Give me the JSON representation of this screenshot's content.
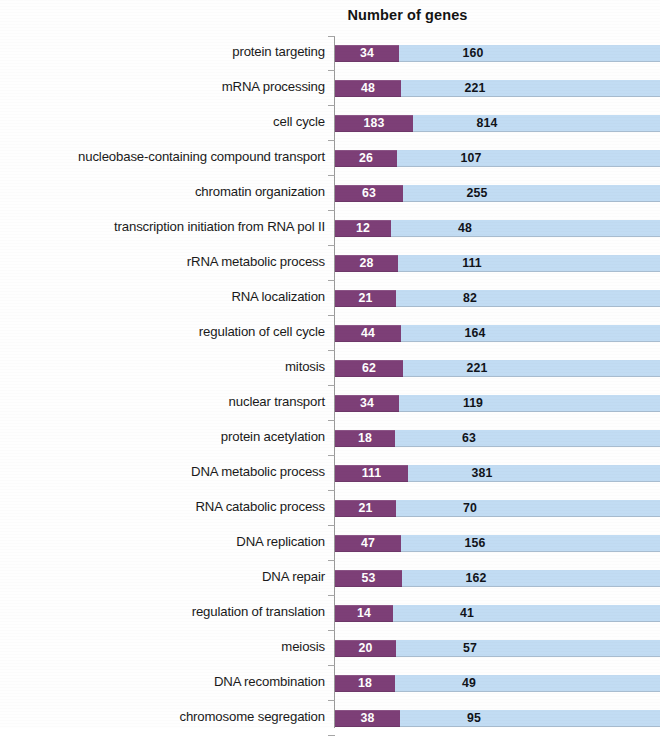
{
  "chart_data": {
    "type": "bar",
    "title": "Number of genes",
    "xlabel": "",
    "ylabel": "",
    "orientation": "horizontal",
    "stacked": true,
    "grid": false,
    "legend_position": "none",
    "axis_visible": true,
    "value_labels": true,
    "categories": [
      "protein targeting",
      "mRNA processing",
      "cell cycle",
      "nucleobase-containing compound transport",
      "chromatin organization",
      "transcription initiation from RNA pol II",
      "rRNA metabolic process",
      "RNA localization",
      "regulation of cell cycle",
      "mitosis",
      "nuclear transport",
      "protein acetylation",
      "DNA metabolic process",
      "RNA catabolic process",
      "DNA replication",
      "DNA repair",
      "regulation of translation",
      "meiosis",
      "DNA recombination",
      "chromosome segregation"
    ],
    "series": [
      {
        "name": "series-1",
        "color": "#7d3f77",
        "values": [
          34,
          48,
          183,
          26,
          63,
          12,
          28,
          21,
          44,
          62,
          34,
          18,
          111,
          21,
          47,
          53,
          14,
          20,
          18,
          38
        ]
      },
      {
        "name": "series-2",
        "color": "#c2dcf3",
        "values": [
          160,
          221,
          814,
          107,
          255,
          48,
          111,
          82,
          164,
          221,
          119,
          63,
          381,
          70,
          156,
          162,
          41,
          57,
          49,
          95
        ]
      }
    ]
  },
  "colors": {
    "series_1": "#7d3f77",
    "series_2": "#c2dcf3",
    "axis": "#9a9a9a",
    "text": "#1a1a1a",
    "background": "#ffffff"
  }
}
